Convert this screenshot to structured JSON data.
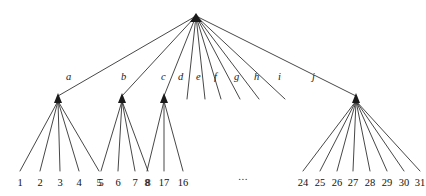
{
  "figure": {
    "kind": "tree-diagram",
    "background_color": "#ffffff",
    "line_color": "#262626",
    "text_color": "#111111",
    "ellipsis": "...",
    "root": {
      "label": "",
      "x": 196,
      "y": 16
    },
    "edge_labels": [
      {
        "text": "a",
        "x": 66,
        "y": 80
      },
      {
        "text": "b",
        "x": 121,
        "y": 80
      },
      {
        "text": "c",
        "x": 161,
        "y": 80
      },
      {
        "text": "d",
        "x": 178,
        "y": 80
      },
      {
        "text": "e",
        "x": 196,
        "y": 80
      },
      {
        "text": "f",
        "x": 214,
        "y": 80
      },
      {
        "text": "g",
        "x": 234,
        "y": 80
      },
      {
        "text": "h",
        "x": 254,
        "y": 80
      },
      {
        "text": "i",
        "x": 278,
        "y": 80
      },
      {
        "text": "j",
        "x": 312,
        "y": 80
      }
    ],
    "internal_nodes": [
      {
        "name": "node-a",
        "x": 58,
        "y": 96
      },
      {
        "name": "node-b",
        "x": 122,
        "y": 96
      },
      {
        "name": "node-c",
        "x": 164,
        "y": 96
      },
      {
        "name": "node-j",
        "x": 356,
        "y": 96
      }
    ],
    "stub_edges": [
      {
        "name": "edge-d",
        "x1": 196,
        "y1": 16,
        "x2": 187,
        "y2": 99
      },
      {
        "name": "edge-e",
        "x1": 196,
        "y1": 16,
        "x2": 205,
        "y2": 99
      },
      {
        "name": "edge-f",
        "x1": 196,
        "y1": 16,
        "x2": 221,
        "y2": 99
      },
      {
        "name": "edge-g",
        "x1": 196,
        "y1": 16,
        "x2": 240,
        "y2": 99
      },
      {
        "name": "edge-h",
        "x1": 196,
        "y1": 16,
        "x2": 259,
        "y2": 99
      },
      {
        "name": "edge-i",
        "x1": 196,
        "y1": 16,
        "x2": 285,
        "y2": 99
      }
    ],
    "leaf_line_top_y": 101,
    "leaf_line_bottom_y": 171,
    "leaf_label_y": 186,
    "leaf_groups": [
      {
        "name": "leaf-group-a",
        "parent": "node-a",
        "leaves": [
          {
            "value": "1",
            "x": 20
          },
          {
            "value": "2",
            "x": 40
          },
          {
            "value": "3",
            "x": 60
          },
          {
            "value": "4",
            "x": 79
          },
          {
            "value": "5",
            "x": 99
          }
        ]
      },
      {
        "name": "leaf-group-b",
        "parent": "node-b",
        "leaves": [
          {
            "value": "5",
            "x": 101
          },
          {
            "value": "6",
            "x": 118
          },
          {
            "value": "7",
            "x": 135
          },
          {
            "value": "8",
            "x": 148
          }
        ]
      },
      {
        "name": "leaf-group-c",
        "parent": "node-c",
        "leaves": [
          {
            "value": "8",
            "x": 147
          },
          {
            "value": "17",
            "x": 164
          },
          {
            "value": "16",
            "x": 183
          }
        ]
      },
      {
        "name": "leaf-group-j",
        "parent": "node-j",
        "leaves": [
          {
            "value": "24",
            "x": 303
          },
          {
            "value": "25",
            "x": 320
          },
          {
            "value": "26",
            "x": 337
          },
          {
            "value": "27",
            "x": 353
          },
          {
            "value": "28",
            "x": 370
          },
          {
            "value": "29",
            "x": 387
          },
          {
            "value": "30",
            "x": 404
          },
          {
            "value": "31",
            "x": 420
          }
        ]
      }
    ],
    "ellipsis_pos": {
      "x": 243,
      "y": 180
    }
  }
}
